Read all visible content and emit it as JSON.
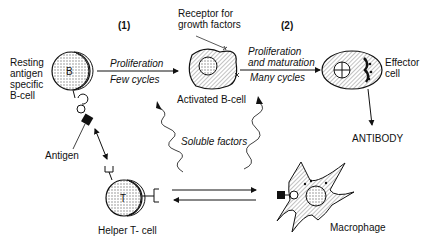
{
  "diagram": {
    "steps": {
      "step1": "(1)",
      "step2": "(2)"
    },
    "cells": {
      "resting_b": {
        "label_lines": [
          "Resting",
          "antigen",
          "specific",
          "B-cell"
        ],
        "glyph": "B"
      },
      "activated_b": {
        "label": "Activated B-cell"
      },
      "effector": {
        "label_lines": [
          "Effector",
          "cell"
        ]
      },
      "helper_t": {
        "label": "Helper T- cell",
        "glyph": "T"
      },
      "macrophage": {
        "label": "Macrophage"
      }
    },
    "arrows": {
      "arrow1": {
        "top": "Proliferation",
        "bottom": "Few cycles"
      },
      "arrow2": {
        "top_lines": [
          "Proliferation",
          "and maturation"
        ],
        "bottom": "Many cycles"
      }
    },
    "annotations": {
      "receptor_lines": [
        "Receptor for",
        "growth factors"
      ],
      "antigen": "Antigen",
      "soluble_factors": "Soluble factors",
      "antibody": "ANTIBODY"
    },
    "colors": {
      "ink": "#111111",
      "fill_dots": "#bdbdbd",
      "background": "#ffffff"
    }
  }
}
